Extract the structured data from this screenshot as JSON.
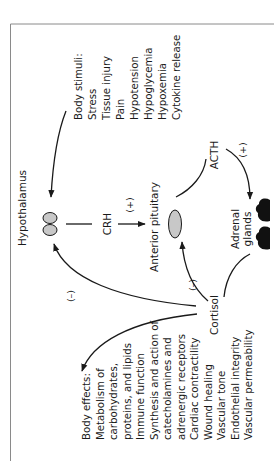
{
  "diagram": {
    "colors": {
      "line": "#1a1a1a",
      "organ_fill": "#c8c8c8",
      "gland_fill": "#111111",
      "frame": "#8a8a8a",
      "background": "#ffffff"
    },
    "orientation": "rotated -90deg (text reads bottom-to-top)",
    "nodes": {
      "hypothalamus": "Hypothalamus",
      "crh": "CRH",
      "anterior_pituitary": "Anterior pituitary",
      "acth": "ACTH",
      "adrenal_line1": "Adrenal",
      "adrenal_line2": "glands",
      "cortisol": "Cortisol"
    },
    "signs": {
      "crh_effect": "(+)",
      "acth_effect": "(+)",
      "cortisol_to_pituitary": "(–)",
      "cortisol_to_hypothalamus": "(–)"
    },
    "body_stimuli": {
      "heading": "Body stimuli:",
      "items": [
        "Stress",
        "Tissue injury",
        "Pain",
        "Hypotension",
        "Hypoglycemia",
        "Hypoxemia",
        "Cytokine release"
      ]
    },
    "body_effects": {
      "heading": "Body effects:",
      "items": [
        "Metabolism of",
        "carbohydrates,",
        "proteins, and lipids",
        "Immune function",
        "Synthesis and action of",
        "catecholamines and",
        "adrenergic receptors",
        "Cardiac contractility",
        "Wound healing",
        "Vascular tone",
        "Endothelial integrity",
        "Vascular permeability"
      ]
    },
    "edges": [
      {
        "from": "Body stimuli",
        "to": "Hypothalamus",
        "sign": ""
      },
      {
        "from": "Hypothalamus",
        "to": "Anterior pituitary",
        "via": "CRH",
        "sign": "(+)"
      },
      {
        "from": "Anterior pituitary",
        "to": "Adrenal glands",
        "via": "ACTH",
        "sign": "(+)"
      },
      {
        "from": "Adrenal glands",
        "to": "Cortisol",
        "sign": ""
      },
      {
        "from": "Cortisol",
        "to": "Anterior pituitary",
        "sign": "(–)"
      },
      {
        "from": "Cortisol",
        "to": "Hypothalamus",
        "sign": "(–)"
      },
      {
        "from": "Cortisol",
        "to": "Body effects",
        "sign": ""
      }
    ]
  }
}
